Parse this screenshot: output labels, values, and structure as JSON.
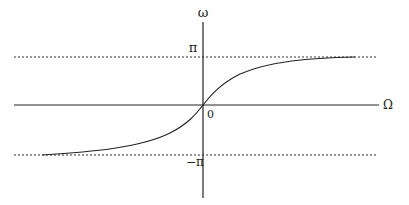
{
  "diagram": {
    "type": "function-plot",
    "axes": {
      "vertical_label": "ω",
      "horizontal_label": "Ω",
      "origin_label": "0"
    },
    "asymptotes": {
      "upper_label": "π",
      "lower_label": "−π",
      "style": "dashed"
    },
    "colors": {
      "line": "#222222",
      "background": "#ffffff"
    }
  }
}
